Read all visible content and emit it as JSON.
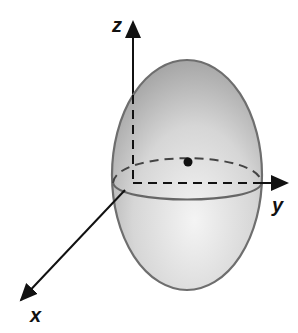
{
  "diagram": {
    "type": "ellipsoid-3d-axes",
    "axes": {
      "z_label": "z",
      "y_label": "y",
      "x_label": "x"
    },
    "colors": {
      "fill_top": "#a9a9a9",
      "fill_bottom": "#eeeeee",
      "outline": "#6e6e6e",
      "axis": "#111111"
    }
  }
}
